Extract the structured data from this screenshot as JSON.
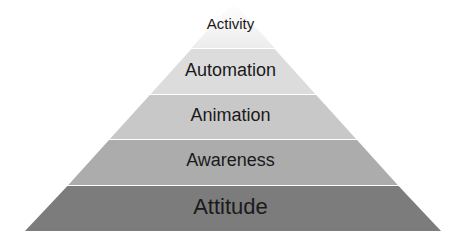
{
  "diagram": {
    "type": "pyramid",
    "layers": [
      {
        "label": "Activity",
        "level": 1,
        "fill": "#f6f6f6"
      },
      {
        "label": "Automation",
        "level": 2,
        "fill": "#dcdcdc"
      },
      {
        "label": "Animation",
        "level": 3,
        "fill": "#c8c8c8"
      },
      {
        "label": "Awareness",
        "level": 4,
        "fill": "#acacac"
      },
      {
        "label": "Attitude",
        "level": 5,
        "fill": "#7c7c7c"
      }
    ]
  }
}
